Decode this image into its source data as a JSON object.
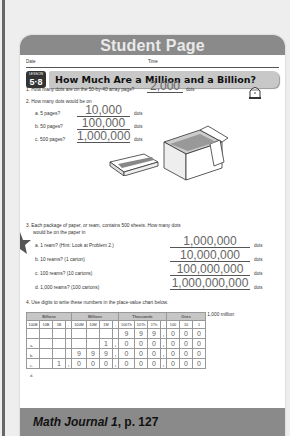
{
  "header": {
    "title": "Student Page"
  },
  "fields": {
    "date": "Date",
    "time": "Time"
  },
  "lesson": {
    "label": "LESSON",
    "number": "5·8",
    "title": "How Much Are a Million and a Billion?"
  },
  "q1": {
    "text": "1.  How many dots are on the 50-by-40 array page?",
    "answer": "2,000",
    "unit": "dots"
  },
  "q2": {
    "text": "2.  How many dots would be on",
    "items": [
      {
        "label": "a.  5 pages?",
        "answer": "10,000",
        "unit": "dots"
      },
      {
        "label": "b.  50 pages?",
        "answer": "100,000",
        "unit": "dots"
      },
      {
        "label": "c.  500 pages?",
        "answer": "1,000,000",
        "unit": "dots"
      }
    ]
  },
  "q3": {
    "text": "3.  Each package of paper, or ream, contains 500 sheets. How many dots",
    "text2": "would be on the paper in",
    "items": [
      {
        "label": "a.  1 ream? (Hint: Look at Problem 2.)",
        "answer": "1,000,000",
        "unit": "dots"
      },
      {
        "label": "b.  10 reams? (1 carton)",
        "answer": "10,000,000",
        "unit": "dots"
      },
      {
        "label": "c.  100 reams? (10 cartons)",
        "answer": "100,000,000",
        "unit": "dots"
      },
      {
        "label": "d.  1,000 reams? (100 cartons)",
        "answer": "1,000,000,000",
        "unit": "dots"
      }
    ]
  },
  "q4": {
    "text": "4.  Use digits to write these numbers in the place-value chart below.",
    "items": [
      "a.  999 thousand",
      "b.  1,000 thousand",
      "c.  999 million",
      "d.  1,000 million"
    ]
  },
  "table": {
    "groups": [
      "Billions",
      "Millions",
      "Thousands",
      "Ones"
    ],
    "columns": [
      "100B",
      "10B",
      "1B",
      ",",
      "100M",
      "10M",
      "1M",
      ",",
      "100Th",
      "10Th",
      "1Th",
      ",",
      "100",
      "10",
      "1"
    ],
    "row_labels": [
      "a.",
      "b.",
      "c.",
      "d."
    ],
    "rows": [
      [
        "",
        "",
        "",
        "",
        "",
        "",
        "",
        "",
        "9",
        "9",
        "9",
        ",",
        "0",
        "0",
        "0"
      ],
      [
        "",
        "",
        "",
        "",
        "",
        "",
        "1",
        ",",
        "0",
        "0",
        "0",
        ",",
        "0",
        "0",
        "0"
      ],
      [
        "",
        "",
        "",
        "",
        "9",
        "9",
        "9",
        ",",
        "0",
        "0",
        "0",
        ",",
        "0",
        "0",
        "0"
      ],
      [
        "",
        "",
        "1",
        ",",
        "0",
        "0",
        "0",
        ",",
        "0",
        "0",
        "0",
        ",",
        "0",
        "0",
        "0"
      ]
    ]
  },
  "footer": {
    "title": "Math Journal 1",
    "page": ", p. 127"
  }
}
